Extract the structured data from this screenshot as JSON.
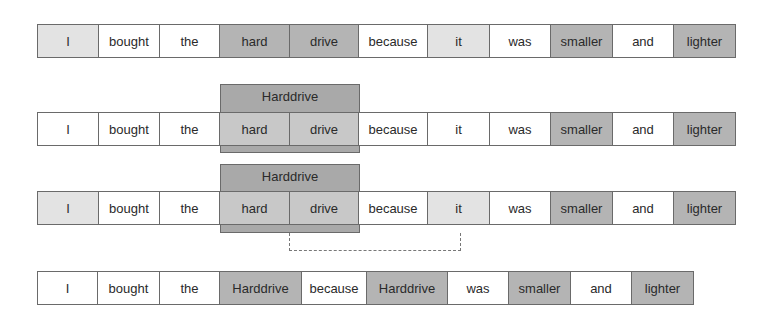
{
  "rows": [
    {
      "name": "original-sentence",
      "tokens": [
        {
          "text": "I",
          "shade": "light"
        },
        {
          "text": "bought",
          "shade": "white"
        },
        {
          "text": "the",
          "shade": "white"
        },
        {
          "text": "hard",
          "shade": "dark"
        },
        {
          "text": "drive",
          "shade": "dark"
        },
        {
          "text": "because",
          "shade": "white"
        },
        {
          "text": "it",
          "shade": "light"
        },
        {
          "text": "was",
          "shade": "white"
        },
        {
          "text": "smaller",
          "shade": "dark"
        },
        {
          "text": "and",
          "shade": "white"
        },
        {
          "text": "lighter",
          "shade": "dark"
        }
      ]
    },
    {
      "name": "merged-span",
      "group_label": "Harddrive",
      "tokens": [
        {
          "text": "I",
          "shade": "white"
        },
        {
          "text": "bought",
          "shade": "white"
        },
        {
          "text": "the",
          "shade": "white"
        },
        {
          "text": "hard",
          "shade": "mid"
        },
        {
          "text": "drive",
          "shade": "mid"
        },
        {
          "text": "because",
          "shade": "white"
        },
        {
          "text": "it",
          "shade": "white"
        },
        {
          "text": "was",
          "shade": "white"
        },
        {
          "text": "smaller",
          "shade": "dark"
        },
        {
          "text": "and",
          "shade": "white"
        },
        {
          "text": "lighter",
          "shade": "dark"
        }
      ]
    },
    {
      "name": "coreference-link",
      "group_label": "Harddrive",
      "tokens": [
        {
          "text": "I",
          "shade": "light"
        },
        {
          "text": "bought",
          "shade": "white"
        },
        {
          "text": "the",
          "shade": "white"
        },
        {
          "text": "hard",
          "shade": "mid"
        },
        {
          "text": "drive",
          "shade": "mid"
        },
        {
          "text": "because",
          "shade": "white"
        },
        {
          "text": "it",
          "shade": "light"
        },
        {
          "text": "was",
          "shade": "white"
        },
        {
          "text": "smaller",
          "shade": "dark"
        },
        {
          "text": "and",
          "shade": "white"
        },
        {
          "text": "lighter",
          "shade": "dark"
        }
      ]
    },
    {
      "name": "resolved-sentence",
      "tokens": [
        {
          "text": "I",
          "shade": "white"
        },
        {
          "text": "bought",
          "shade": "white"
        },
        {
          "text": "the",
          "shade": "white"
        },
        {
          "text": "Harddrive",
          "shade": "dark"
        },
        {
          "text": "because",
          "shade": "white"
        },
        {
          "text": "Harddrive",
          "shade": "dark"
        },
        {
          "text": "was",
          "shade": "white"
        },
        {
          "text": "smaller",
          "shade": "dark"
        },
        {
          "text": "and",
          "shade": "white"
        },
        {
          "text": "lighter",
          "shade": "dark"
        }
      ]
    }
  ]
}
